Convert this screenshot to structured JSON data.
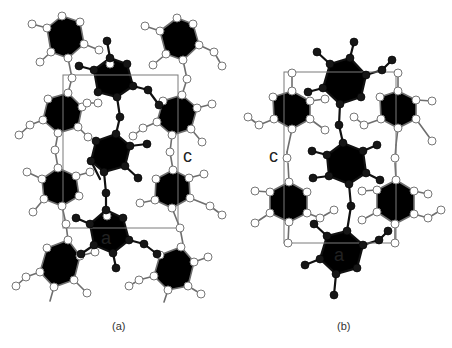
{
  "figure": {
    "type": "crystal-packing-diagram",
    "colors": {
      "highlight_molecule": "#161616",
      "neighbor_molecules": "#ffffff",
      "neighbor_bonds": "#6e6e6e",
      "unit_cell": "#7a7a7a"
    }
  },
  "panels": [
    {
      "id": "a",
      "caption": "(a)",
      "axis_labels": [
        {
          "text": "c",
          "x": 183,
          "y": 162
        },
        {
          "text": "a",
          "x": 101,
          "y": 244
        }
      ],
      "unit_cell": {
        "x": 63,
        "y": 75,
        "w": 115,
        "h": 153
      }
    },
    {
      "id": "b",
      "caption": "(b)",
      "axis_labels": [
        {
          "text": "c",
          "x": 269,
          "y": 162
        },
        {
          "text": "a",
          "x": 334,
          "y": 261
        }
      ],
      "unit_cell": {
        "x": 284,
        "y": 72,
        "w": 112,
        "h": 171
      }
    }
  ]
}
